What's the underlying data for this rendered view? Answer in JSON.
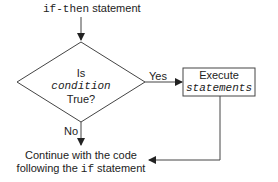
{
  "diagram": {
    "title": {
      "code": "if-then",
      "text": " statement"
    },
    "decision": {
      "line1": "Is",
      "line2": "condition",
      "line3": "True?"
    },
    "yes_label": "Yes",
    "no_label": "No",
    "process": {
      "line1": "Execute",
      "line2": "statements"
    },
    "end": {
      "line1": "Continue with the code",
      "line2_pre": "following the ",
      "line2_code": "if",
      "line2_post": " statement"
    }
  }
}
